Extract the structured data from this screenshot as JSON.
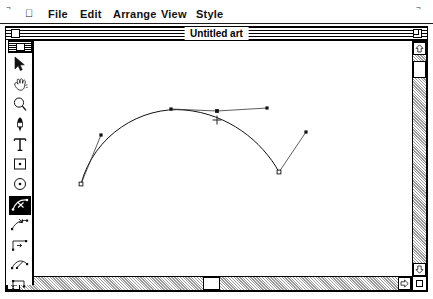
{
  "menubar": {
    "apple_icon": "apple-icon",
    "items": [
      "File",
      "Edit",
      "Arrange",
      "View",
      "Style"
    ]
  },
  "window": {
    "title": "Untitled art",
    "close_box": "close-box",
    "zoom_box": "zoom-box",
    "grow_box": "grow-box"
  },
  "palette": {
    "swatch": "fill-stroke-swatch",
    "selected_tool": "bezier-scissors",
    "tools": [
      {
        "name": "arrow",
        "icon": "arrow-icon",
        "selected": false
      },
      {
        "name": "hand",
        "icon": "hand-icon",
        "selected": false
      },
      {
        "name": "zoom",
        "icon": "magnifier-icon",
        "selected": false
      },
      {
        "name": "pen",
        "icon": "pen-icon",
        "selected": false
      },
      {
        "name": "text",
        "icon": "text-t-icon",
        "selected": false
      },
      {
        "name": "rectangle",
        "icon": "rectangle-icon",
        "selected": false
      },
      {
        "name": "ellipse",
        "icon": "ellipse-icon",
        "selected": false
      },
      {
        "name": "bezier-scissors",
        "icon": "scissors-curve-icon",
        "selected": true
      },
      {
        "name": "add-anchor",
        "icon": "add-anchor-icon",
        "selected": false
      },
      {
        "name": "convert-anchor",
        "icon": "convert-anchor-icon",
        "selected": false
      },
      {
        "name": "split-path",
        "icon": "split-path-icon",
        "selected": false
      },
      {
        "name": "corner-path",
        "icon": "corner-path-icon",
        "selected": false
      }
    ]
  },
  "scrollbars": {
    "vertical": {
      "thumb_top_px": 19,
      "up_arrow": "scroll-up-arrow-icon",
      "down_arrow": "scroll-down-arrow-icon"
    },
    "horizontal": {
      "thumb_left_px": 196,
      "left_arrow": "scroll-left-arrow-icon",
      "right_arrow": "scroll-right-arrow-icon"
    }
  },
  "artwork": {
    "stroke_color": "#111111",
    "handle_color": "#333333",
    "cursor": {
      "type": "crosshair",
      "x": 211,
      "y": 79,
      "size": 9
    },
    "path_d": "M 75 143 C 88 94 135 65 179 69 C 222 73 256 100 273 131",
    "anchors": [
      {
        "name": "anchor-start",
        "x": 75,
        "y": 143,
        "shape": "hollow-square"
      },
      {
        "name": "anchor-middle",
        "x": 211,
        "y": 70,
        "shape": "filled-square"
      },
      {
        "name": "anchor-end",
        "x": 273,
        "y": 131,
        "shape": "hollow-square"
      }
    ],
    "handles": [
      {
        "name": "handle-start-out",
        "from_x": 75,
        "from_y": 143,
        "x": 95,
        "y": 94
      },
      {
        "name": "handle-mid-in",
        "from_x": 211,
        "from_y": 70,
        "x": 165,
        "y": 68
      },
      {
        "name": "handle-mid-out",
        "from_x": 211,
        "from_y": 70,
        "x": 261,
        "y": 67
      },
      {
        "name": "handle-end-out",
        "from_x": 273,
        "from_y": 131,
        "x": 300,
        "y": 91
      }
    ]
  }
}
